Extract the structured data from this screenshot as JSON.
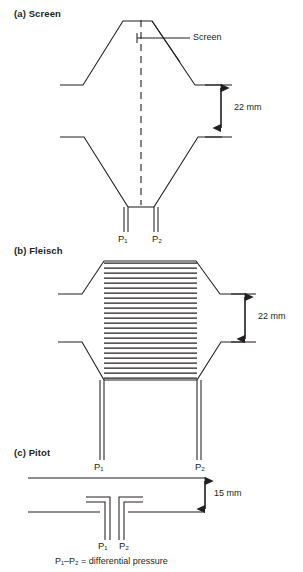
{
  "figure": {
    "title_a": "(a) Screen",
    "title_b": "(b) Fleisch",
    "title_c": "(c) Pitot",
    "annotation_screen": "Screen",
    "dim_a": "22 mm",
    "dim_b": "22 mm",
    "dim_c": "15 mm",
    "caption": "P₁–P₂ = differential pressure",
    "line_color": "#231f20",
    "background": "#ffffff"
  },
  "ports": {
    "a": {
      "p1": "P₁",
      "p2": "P₂"
    },
    "b": {
      "p1": "P₁",
      "p2": "P₂"
    },
    "c": {
      "p1": "P₁",
      "p2": "P₂"
    }
  },
  "panels": [
    {
      "id": "a",
      "label": "(a) Screen",
      "type": "screen-pneumotachograph",
      "dimension": "22 mm",
      "annotations": [
        "Screen"
      ],
      "ports": [
        "P₁",
        "P₂"
      ]
    },
    {
      "id": "b",
      "label": "(b) Fleisch",
      "type": "fleisch-pneumotachograph",
      "dimension": "22 mm",
      "mesh_lines": 24,
      "ports": [
        "P₁",
        "P₂"
      ]
    },
    {
      "id": "c",
      "label": "(c) Pitot",
      "type": "pitot-pneumotachograph",
      "dimension": "15 mm",
      "ports": [
        "P₁",
        "P₂"
      ]
    }
  ]
}
